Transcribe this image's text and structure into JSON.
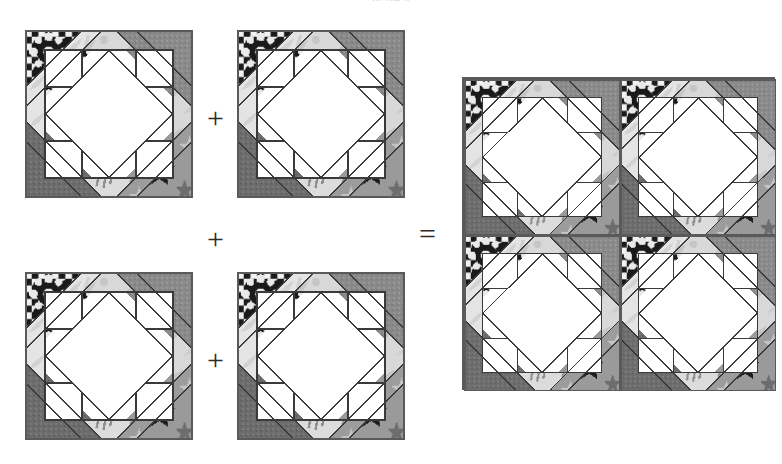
{
  "figure": {
    "type": "quilt-block-assembly-diagram",
    "cut_off_header_text": "of the p",
    "background_color": "#ffffff"
  },
  "operators": {
    "plus": "+",
    "equals": "="
  },
  "palette": {
    "white_patch": "#ffffff",
    "outline": "#3a3a3a",
    "light_print": "#d8d8d8",
    "light_print_alt": "#e4e4e4",
    "mid_gray": "#8a8a8a",
    "dark_gray": "#6d6d6d",
    "darker_gray": "#5f5f5f",
    "black_print": "#1a1a1a",
    "block_border": "#5a5a5a"
  },
  "blocks": [
    {
      "id": "block-1",
      "label": "Block 1",
      "position": "top-left",
      "x": 25,
      "y": 30,
      "size": 168,
      "corners": {
        "top_left": "black-floral-print",
        "top_right": "mid-gray-solid",
        "bottom_left": "dark-gray-solid",
        "bottom_right": "gray-star-print"
      }
    },
    {
      "id": "block-2",
      "label": "Block 2",
      "position": "top-right",
      "x": 237,
      "y": 30,
      "size": 168,
      "corners": {
        "top_left": "black-floral-print",
        "top_right": "mid-gray-solid",
        "bottom_left": "dark-gray-solid",
        "bottom_right": "gray-star-print"
      }
    },
    {
      "id": "block-3",
      "label": "Block 3",
      "position": "bottom-left",
      "x": 25,
      "y": 272,
      "size": 168,
      "corners": {
        "top_left": "black-floral-print",
        "top_right": "mid-gray-solid",
        "bottom_left": "dark-gray-solid",
        "bottom_right": "gray-star-print"
      }
    },
    {
      "id": "block-4",
      "label": "Block 4",
      "position": "bottom-centre",
      "x": 237,
      "y": 272,
      "size": 168,
      "corners": {
        "top_left": "black-floral-print",
        "top_right": "mid-gray-solid",
        "bottom_left": "dark-gray-solid",
        "bottom_right": "gray-star-print"
      }
    }
  ],
  "result": {
    "id": "combined-block",
    "label": "Combined four-block unit",
    "x": 462,
    "y": 77,
    "size": 313,
    "grid": "2x2",
    "sub_blocks": 4
  },
  "operator_positions": [
    {
      "id": "plus-top",
      "symbol": "+",
      "x": 207,
      "y": 103
    },
    {
      "id": "plus-middle",
      "symbol": "+",
      "x": 207,
      "y": 224
    },
    {
      "id": "plus-bottom",
      "symbol": "+",
      "x": 207,
      "y": 345
    },
    {
      "id": "equals",
      "symbol": "=",
      "x": 419,
      "y": 219
    }
  ]
}
